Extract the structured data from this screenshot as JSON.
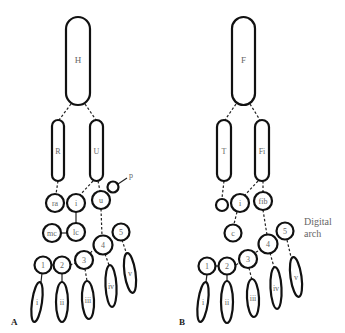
{
  "panels": {
    "A": {
      "label": "A",
      "stylopod": "H",
      "zeugopod": [
        "R",
        "U"
      ],
      "proximal_carpals": [
        "ra",
        "i",
        "u"
      ],
      "pisiform": "p",
      "distal_row": [
        "mc",
        "lc"
      ],
      "distal_carpals": [
        "1",
        "2",
        "3",
        "4",
        "5"
      ],
      "digits": [
        "i",
        "ii",
        "iii",
        "iv",
        "v"
      ]
    },
    "B": {
      "label": "B",
      "stylopod": "F",
      "zeugopod": [
        "T",
        "Fi"
      ],
      "proximal_tarsals": [
        "",
        "i",
        "fib"
      ],
      "centrale": "c",
      "distal_tarsals": [
        "1",
        "2",
        "3",
        "4",
        "5"
      ],
      "digits": [
        "i",
        "ii",
        "iii",
        "iv",
        "v"
      ],
      "annotation": [
        "Digital",
        "arch"
      ]
    }
  },
  "colors": {
    "outline": "#111111",
    "label": "#666666",
    "background": "#ffffff"
  }
}
